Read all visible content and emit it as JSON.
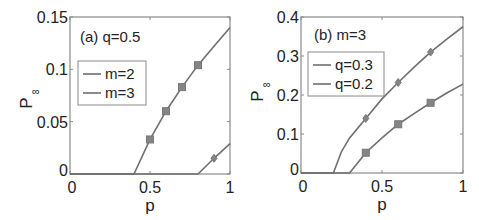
{
  "chart_data": [
    {
      "type": "line",
      "panel": "a",
      "annotation": "(a) q=0.5",
      "xlabel": "p",
      "ylabel": "P",
      "ylabel_subscript": "∞",
      "xlim": [
        0,
        1
      ],
      "ylim": [
        0,
        0.15
      ],
      "xticks": [
        "0",
        "0.5",
        "1"
      ],
      "yticks": [
        "0",
        "0.05",
        "0.1",
        "0.15"
      ],
      "grid": false,
      "legend_position": "upper left",
      "series": [
        {
          "name": "m=2",
          "color": "#6f6f6f",
          "line_x": [
            0,
            0.4,
            0.5,
            0.6,
            0.7,
            0.8,
            0.9,
            1.0
          ],
          "line_y": [
            0,
            0,
            0.033,
            0.06,
            0.083,
            0.104,
            0.122,
            0.14
          ],
          "marker": "square",
          "markers_x": [
            0.5,
            0.6,
            0.7,
            0.8
          ],
          "markers_y": [
            0.033,
            0.06,
            0.083,
            0.104
          ]
        },
        {
          "name": "m=3",
          "color": "#6f6f6f",
          "line_x": [
            0,
            0.8,
            0.9,
            1.0
          ],
          "line_y": [
            0,
            0,
            0.015,
            0.029
          ],
          "marker": "diamond",
          "markers_x": [
            0.9
          ],
          "markers_y": [
            0.015
          ]
        }
      ]
    },
    {
      "type": "line",
      "panel": "b",
      "annotation": "(b) m=3",
      "xlabel": "p",
      "ylabel": "P",
      "ylabel_subscript": "∞",
      "xlim": [
        0,
        1
      ],
      "ylim": [
        0,
        0.4
      ],
      "xticks": [
        "0",
        "0.5",
        "1"
      ],
      "yticks": [
        "0",
        "0.1",
        "0.2",
        "0.3",
        "0.4"
      ],
      "grid": false,
      "legend_position": "upper left",
      "series": [
        {
          "name": "q=0.3",
          "color": "#6f6f6f",
          "line_x": [
            0,
            0.2,
            0.25,
            0.3,
            0.4,
            0.5,
            0.6,
            0.7,
            0.8,
            0.9,
            1.0
          ],
          "line_y": [
            0,
            0,
            0.055,
            0.09,
            0.14,
            0.19,
            0.232,
            0.272,
            0.31,
            0.343,
            0.375
          ],
          "marker": "diamond",
          "markers_x": [
            0.4,
            0.6,
            0.8
          ],
          "markers_y": [
            0.14,
            0.232,
            0.31
          ]
        },
        {
          "name": "q=0.2",
          "color": "#6f6f6f",
          "line_x": [
            0,
            0.3,
            0.4,
            0.5,
            0.6,
            0.7,
            0.8,
            0.9,
            1.0
          ],
          "line_y": [
            0,
            0,
            0.052,
            0.09,
            0.125,
            0.153,
            0.18,
            0.205,
            0.228
          ],
          "marker": "square",
          "markers_x": [
            0.4,
            0.6,
            0.8
          ],
          "markers_y": [
            0.052,
            0.125,
            0.18
          ]
        }
      ]
    }
  ]
}
